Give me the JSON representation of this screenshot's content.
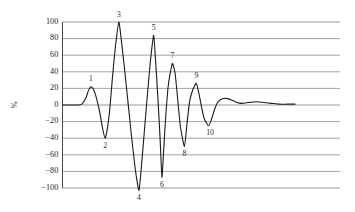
{
  "chart_data": {
    "type": "line",
    "title": "",
    "xlabel": "",
    "ylabel": "%",
    "ylim": [
      -110,
      105
    ],
    "xlim": [
      0,
      100
    ],
    "grid": true,
    "legend": null,
    "axis": {
      "y_ticks": [
        100,
        80,
        60,
        40,
        20,
        0,
        -20,
        -40,
        -60,
        -80,
        -100
      ],
      "y_tick_labels": [
        "100",
        "80",
        "60",
        "40",
        "20",
        "0",
        "−20",
        "−40",
        "−60",
        "−80",
        "−100"
      ],
      "x_ticks": [],
      "x_tick_labels": []
    },
    "annotations": [
      {
        "label": "1",
        "x": 11.0,
        "y": 22,
        "position": "above"
      },
      {
        "label": "2",
        "x": 16.5,
        "y": -40,
        "position": "below"
      },
      {
        "label": "3",
        "x": 21.8,
        "y": 100,
        "position": "above"
      },
      {
        "label": "4",
        "x": 29.6,
        "y": -103,
        "position": "below"
      },
      {
        "label": "5",
        "x": 35.3,
        "y": 84,
        "position": "above"
      },
      {
        "label": "6",
        "x": 38.5,
        "y": -87,
        "position": "below"
      },
      {
        "label": "7",
        "x": 42.5,
        "y": 50,
        "position": "above"
      },
      {
        "label": "8",
        "x": 47.2,
        "y": -50,
        "position": "below"
      },
      {
        "label": "9",
        "x": 51.8,
        "y": 26,
        "position": "above"
      },
      {
        "label": "10",
        "x": 56.5,
        "y": -25,
        "position": "below"
      }
    ],
    "series": [
      {
        "name": "damped oscillation",
        "color": "#1a1a1a",
        "points": [
          [
            0.0,
            0
          ],
          [
            2.0,
            0
          ],
          [
            4.0,
            0
          ],
          [
            6.0,
            0
          ],
          [
            7.5,
            1
          ],
          [
            9.0,
            8
          ],
          [
            10.0,
            17
          ],
          [
            11.0,
            22
          ],
          [
            12.0,
            19
          ],
          [
            13.0,
            10
          ],
          [
            14.5,
            -10
          ],
          [
            15.5,
            -28
          ],
          [
            16.5,
            -40
          ],
          [
            17.3,
            -30
          ],
          [
            18.3,
            -5
          ],
          [
            19.3,
            32
          ],
          [
            20.4,
            68
          ],
          [
            21.8,
            100
          ],
          [
            23.0,
            72
          ],
          [
            24.2,
            38
          ],
          [
            25.4,
            2
          ],
          [
            26.8,
            -40
          ],
          [
            28.2,
            -78
          ],
          [
            29.6,
            -103
          ],
          [
            30.6,
            -72
          ],
          [
            31.6,
            -35
          ],
          [
            32.8,
            10
          ],
          [
            34.0,
            52
          ],
          [
            35.3,
            84
          ],
          [
            36.2,
            45
          ],
          [
            37.0,
            5
          ],
          [
            37.8,
            -42
          ],
          [
            38.5,
            -87
          ],
          [
            39.2,
            -52
          ],
          [
            40.0,
            -12
          ],
          [
            41.0,
            25
          ],
          [
            42.5,
            50
          ],
          [
            43.6,
            38
          ],
          [
            44.5,
            10
          ],
          [
            45.6,
            -25
          ],
          [
            47.2,
            -50
          ],
          [
            48.2,
            -22
          ],
          [
            49.2,
            4
          ],
          [
            50.4,
            18
          ],
          [
            51.8,
            26
          ],
          [
            52.8,
            14
          ],
          [
            53.8,
            -2
          ],
          [
            54.8,
            -16
          ],
          [
            56.5,
            -25
          ],
          [
            57.6,
            -18
          ],
          [
            58.8,
            -6
          ],
          [
            60.0,
            3
          ],
          [
            61.5,
            7
          ],
          [
            63.5,
            8
          ],
          [
            65.5,
            6
          ],
          [
            67.5,
            3
          ],
          [
            69.5,
            2
          ],
          [
            72.0,
            3
          ],
          [
            75.0,
            4
          ],
          [
            78.0,
            3
          ],
          [
            81.0,
            2
          ],
          [
            84.0,
            1
          ],
          [
            87.0,
            1
          ],
          [
            90.0,
            1
          ]
        ]
      }
    ]
  },
  "ylabel_text": "%"
}
